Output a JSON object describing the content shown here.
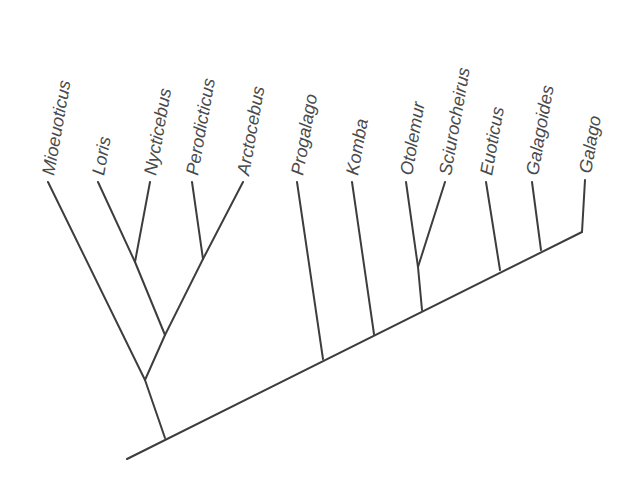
{
  "diagram": {
    "type": "cladogram",
    "line_color": "#3d3d3d",
    "label_color": "#4a4a4a",
    "taxa": [
      {
        "name": "Mioeuoticus",
        "tip": [
          48,
          176
        ],
        "base": [
          145,
          380
        ]
      },
      {
        "name": "Loris",
        "tip": [
          98,
          176
        ],
        "base": [
          135,
          262
        ]
      },
      {
        "name": "Nycticebus",
        "tip": [
          150,
          176
        ],
        "base": [
          135,
          262
        ]
      },
      {
        "name": "Perodicticus",
        "tip": [
          192,
          176
        ],
        "base": [
          203,
          259
        ]
      },
      {
        "name": "Arctocebus",
        "tip": [
          243,
          176
        ],
        "base": [
          203,
          259
        ]
      },
      {
        "name": "Progalago",
        "tip": [
          297,
          176
        ],
        "base": [
          323,
          359
        ]
      },
      {
        "name": "Komba",
        "tip": [
          352,
          176
        ],
        "base": [
          374,
          334
        ]
      },
      {
        "name": "Otolemur",
        "tip": [
          406,
          176
        ],
        "base": [
          418,
          267
        ]
      },
      {
        "name": "Sciurocheirus",
        "tip": [
          445,
          176
        ],
        "base": [
          418,
          267
        ]
      },
      {
        "name": "Euoticus",
        "tip": [
          486,
          176
        ],
        "base": [
          500,
          270
        ]
      },
      {
        "name": "Galagoides",
        "tip": [
          532,
          176
        ],
        "base": [
          541,
          250
        ]
      },
      {
        "name": "Galago",
        "tip": [
          585,
          174
        ],
        "base": [
          582,
          232
        ]
      }
    ],
    "internal_branches": [
      {
        "from": [
          135,
          262
        ],
        "to": [
          165,
          335
        ],
        "label": "Loris-Nycticebus clade"
      },
      {
        "from": [
          203,
          259
        ],
        "to": [
          165,
          335
        ],
        "label": "Perodicticus-Arctocebus clade"
      },
      {
        "from": [
          165,
          335
        ],
        "to": [
          145,
          380
        ],
        "label": "Lorisinae stem"
      },
      {
        "from": [
          145,
          380
        ],
        "to": [
          165,
          438
        ],
        "label": "Lorisidae stem"
      },
      {
        "from": [
          418,
          267
        ],
        "to": [
          422,
          310
        ],
        "label": "Otolemur-Sciurocheirus stem"
      }
    ],
    "backbone": {
      "from": [
        127,
        459
      ],
      "to": [
        582,
        232
      ]
    }
  }
}
